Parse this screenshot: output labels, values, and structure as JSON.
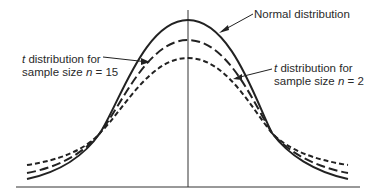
{
  "diagram": {
    "type": "probability density curves comparison",
    "curves": [
      {
        "name": "normal",
        "label": "Normal distribution",
        "style": "solid",
        "peak_y": 20
      },
      {
        "name": "t-n15",
        "label_line1_t": "t",
        "label_line1_rest": " distribution for",
        "label_line2_pre": "sample size ",
        "label_line2_n": "n",
        "label_line2_post": " = 15",
        "style": "long-dash",
        "peak_y": 40
      },
      {
        "name": "t-n2",
        "label_line1_t": "t",
        "label_line1_rest": " distribution for",
        "label_line2_pre": "sample size ",
        "label_line2_n": "n",
        "label_line2_post": " = 2",
        "style": "short-dash",
        "peak_y": 58
      }
    ],
    "axis": {
      "baseline": true,
      "center_line": true
    },
    "colors": {
      "line": "#222222",
      "background": "#ffffff"
    }
  }
}
